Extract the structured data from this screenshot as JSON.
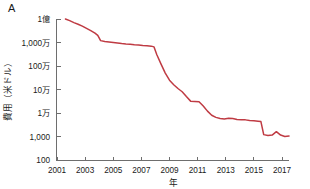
{
  "figure": {
    "panel_label": "A",
    "background_color": "#ffffff"
  },
  "chart_data": {
    "type": "line",
    "title": "",
    "xlabel": "年",
    "ylabel": "費用（米ドル）",
    "yscale": "log",
    "ylim": [
      100,
      100000000
    ],
    "xlim": [
      2001,
      2018
    ],
    "grid": false,
    "legend": null,
    "line_color": "#bf3b43",
    "series": [
      {
        "name": "費用（米ドル）",
        "x": [
          2001.6,
          2001.9,
          2002.2,
          2002.5,
          2002.8,
          2003.1,
          2003.4,
          2003.7,
          2003.9,
          2004.1,
          2004.4,
          2004.7,
          2005.0,
          2005.3,
          2005.6,
          2005.9,
          2006.2,
          2006.5,
          2006.8,
          2007.1,
          2007.4,
          2007.7,
          2007.9,
          2008.1,
          2008.4,
          2008.7,
          2009.0,
          2009.3,
          2009.6,
          2009.9,
          2010.2,
          2010.5,
          2010.8,
          2011.1,
          2011.4,
          2011.7,
          2012.0,
          2012.3,
          2012.6,
          2012.9,
          2013.2,
          2013.5,
          2013.8,
          2014.1,
          2014.4,
          2014.7,
          2015.0,
          2015.3,
          2015.5,
          2015.7,
          2016.0,
          2016.3,
          2016.6,
          2016.9,
          2017.2,
          2017.5
        ],
        "y": [
          100000000,
          85000000,
          70000000,
          60000000,
          50000000,
          40000000,
          32000000,
          25000000,
          20000000,
          12000000,
          11000000,
          10500000,
          10000000,
          9500000,
          9000000,
          8600000,
          8400000,
          8000000,
          7800000,
          7500000,
          7300000,
          7000000,
          6500000,
          3000000,
          1200000,
          500000,
          250000,
          160000,
          110000,
          80000,
          50000,
          32000,
          31000,
          30000,
          20000,
          12000,
          8000,
          6500,
          5800,
          5600,
          6000,
          5800,
          5300,
          5200,
          5100,
          4800,
          4700,
          4500,
          4300,
          1200,
          1100,
          1150,
          1600,
          1150,
          1000,
          1050
        ],
        "color": "#bf3b43"
      }
    ],
    "y_ticks": [
      {
        "value": 100000000,
        "label": "1億"
      },
      {
        "value": 10000000,
        "label": "1,000万"
      },
      {
        "value": 1000000,
        "label": "100万"
      },
      {
        "value": 100000,
        "label": "10万"
      },
      {
        "value": 10000,
        "label": "1万"
      },
      {
        "value": 1000,
        "label": "1,000"
      },
      {
        "value": 100,
        "label": "100"
      }
    ],
    "x_ticks": [
      {
        "value": 2001,
        "label": "2001"
      },
      {
        "value": 2003,
        "label": "2003"
      },
      {
        "value": 2005,
        "label": "2005"
      },
      {
        "value": 2007,
        "label": "2007"
      },
      {
        "value": 2009,
        "label": "2009"
      },
      {
        "value": 2011,
        "label": "2011"
      },
      {
        "value": 2013,
        "label": "2013"
      },
      {
        "value": 2015,
        "label": "2015"
      },
      {
        "value": 2017,
        "label": "2017"
      }
    ]
  }
}
